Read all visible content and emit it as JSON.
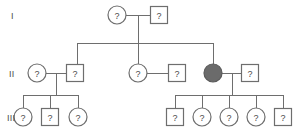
{
  "diagram": {
    "type": "pedigree-chart",
    "unknown_symbol": "?",
    "colors": {
      "line": "#6e6e6e",
      "symbol_stroke": "#6e6e6e",
      "symbol_fill": "#ffffff",
      "affected_fill": "#6b6b6b",
      "text": "#4a4a4a",
      "background": "#ffffff"
    },
    "generation_labels": [
      {
        "id": "gen-label-1",
        "text": "I",
        "x": 11,
        "y": 15
      },
      {
        "id": "gen-label-2",
        "text": "II",
        "x": 9,
        "y": 73
      },
      {
        "id": "gen-label-3",
        "text": "III",
        "x": 7,
        "y": 117
      }
    ],
    "individuals": [
      {
        "id": "i-1",
        "generation": "I",
        "sex": "female",
        "shape": "circle",
        "label": "?",
        "affected": false,
        "cx": 117,
        "cy": 15,
        "r": 9
      },
      {
        "id": "i-2",
        "generation": "I",
        "sex": "male",
        "shape": "square",
        "label": "?",
        "affected": false,
        "cx": 159,
        "cy": 15,
        "size": 17
      },
      {
        "id": "ii-1",
        "generation": "II",
        "sex": "female",
        "shape": "circle",
        "label": "?",
        "affected": false,
        "cx": 37,
        "cy": 73,
        "r": 9
      },
      {
        "id": "ii-2",
        "generation": "II",
        "sex": "male",
        "shape": "square",
        "label": "?",
        "affected": false,
        "cx": 75,
        "cy": 73,
        "size": 17
      },
      {
        "id": "ii-3",
        "generation": "II",
        "sex": "female",
        "shape": "circle",
        "label": "?",
        "affected": false,
        "cx": 138,
        "cy": 73,
        "r": 9
      },
      {
        "id": "ii-4",
        "generation": "II",
        "sex": "male",
        "shape": "square",
        "label": "?",
        "affected": false,
        "cx": 177,
        "cy": 73,
        "size": 17
      },
      {
        "id": "ii-5",
        "generation": "II",
        "sex": "female",
        "shape": "circle",
        "label": "",
        "affected": true,
        "cx": 213,
        "cy": 73,
        "r": 9
      },
      {
        "id": "ii-6",
        "generation": "II",
        "sex": "male",
        "shape": "square",
        "label": "?",
        "affected": false,
        "cx": 250,
        "cy": 73,
        "size": 17
      },
      {
        "id": "iii-1",
        "generation": "III",
        "sex": "female",
        "shape": "circle",
        "label": "?",
        "affected": false,
        "cx": 23,
        "cy": 117,
        "r": 9
      },
      {
        "id": "iii-2",
        "generation": "III",
        "sex": "male",
        "shape": "square",
        "label": "?",
        "affected": false,
        "cx": 50,
        "cy": 117,
        "size": 17
      },
      {
        "id": "iii-3",
        "generation": "III",
        "sex": "female",
        "shape": "circle",
        "label": "?",
        "affected": false,
        "cx": 78,
        "cy": 117,
        "r": 9
      },
      {
        "id": "iii-4",
        "generation": "III",
        "sex": "male",
        "shape": "square",
        "label": "?",
        "affected": false,
        "cx": 175,
        "cy": 117,
        "size": 17
      },
      {
        "id": "iii-5",
        "generation": "III",
        "sex": "female",
        "shape": "circle",
        "label": "?",
        "affected": false,
        "cx": 202,
        "cy": 117,
        "r": 9
      },
      {
        "id": "iii-6",
        "generation": "III",
        "sex": "female",
        "shape": "circle",
        "label": "?",
        "affected": false,
        "cx": 229,
        "cy": 117,
        "r": 9
      },
      {
        "id": "iii-7",
        "generation": "III",
        "sex": "female",
        "shape": "circle",
        "label": "?",
        "affected": false,
        "cx": 256,
        "cy": 117,
        "r": 9
      },
      {
        "id": "iii-8",
        "generation": "III",
        "sex": "male",
        "shape": "square",
        "label": "?",
        "affected": false,
        "cx": 283,
        "cy": 117,
        "size": 17
      }
    ],
    "connectors": [
      {
        "id": "mating-i",
        "kind": "mating",
        "x1": 126,
        "y1": 15,
        "x2": 150,
        "y2": 15
      },
      {
        "id": "descent-i",
        "kind": "descent",
        "x1": 138,
        "y1": 15,
        "x2": 138,
        "y2": 43
      },
      {
        "id": "sibline-ii",
        "kind": "sibship",
        "x1": 77,
        "y1": 43,
        "x2": 213,
        "y2": 43
      },
      {
        "id": "drop-ii-1",
        "kind": "drop",
        "x1": 77,
        "y1": 43,
        "x2": 77,
        "y2": 64
      },
      {
        "id": "drop-ii-3",
        "kind": "drop",
        "x1": 138,
        "y1": 43,
        "x2": 138,
        "y2": 64
      },
      {
        "id": "drop-ii-5",
        "kind": "drop",
        "x1": 213,
        "y1": 43,
        "x2": 213,
        "y2": 64
      },
      {
        "id": "mating-ii-a",
        "kind": "mating",
        "x1": 46,
        "y1": 73,
        "x2": 66,
        "y2": 73
      },
      {
        "id": "mating-ii-b",
        "kind": "mating",
        "x1": 147,
        "y1": 73,
        "x2": 168,
        "y2": 73
      },
      {
        "id": "mating-ii-c",
        "kind": "mating",
        "x1": 222,
        "y1": 73,
        "x2": 241,
        "y2": 73
      },
      {
        "id": "descent-ii-a",
        "kind": "descent",
        "x1": 56,
        "y1": 73,
        "x2": 56,
        "y2": 95
      },
      {
        "id": "descent-ii-c",
        "kind": "descent",
        "x1": 232,
        "y1": 73,
        "x2": 232,
        "y2": 95
      },
      {
        "id": "sibline-iii-left",
        "kind": "sibship",
        "x1": 23,
        "y1": 95,
        "x2": 78,
        "y2": 95
      },
      {
        "id": "sibline-iii-right",
        "kind": "sibship",
        "x1": 175,
        "y1": 95,
        "x2": 283,
        "y2": 95
      },
      {
        "id": "drop-iii-1",
        "kind": "drop",
        "x1": 23,
        "y1": 95,
        "x2": 23,
        "y2": 108
      },
      {
        "id": "drop-iii-2",
        "kind": "drop",
        "x1": 50,
        "y1": 95,
        "x2": 50,
        "y2": 108
      },
      {
        "id": "drop-iii-3",
        "kind": "drop",
        "x1": 78,
        "y1": 95,
        "x2": 78,
        "y2": 108
      },
      {
        "id": "drop-iii-4",
        "kind": "drop",
        "x1": 175,
        "y1": 95,
        "x2": 175,
        "y2": 108
      },
      {
        "id": "drop-iii-5",
        "kind": "drop",
        "x1": 202,
        "y1": 95,
        "x2": 202,
        "y2": 108
      },
      {
        "id": "drop-iii-6",
        "kind": "drop",
        "x1": 229,
        "y1": 95,
        "x2": 229,
        "y2": 108
      },
      {
        "id": "drop-iii-7",
        "kind": "drop",
        "x1": 256,
        "y1": 95,
        "x2": 256,
        "y2": 108
      },
      {
        "id": "drop-iii-8",
        "kind": "drop",
        "x1": 283,
        "y1": 95,
        "x2": 283,
        "y2": 108
      }
    ]
  }
}
